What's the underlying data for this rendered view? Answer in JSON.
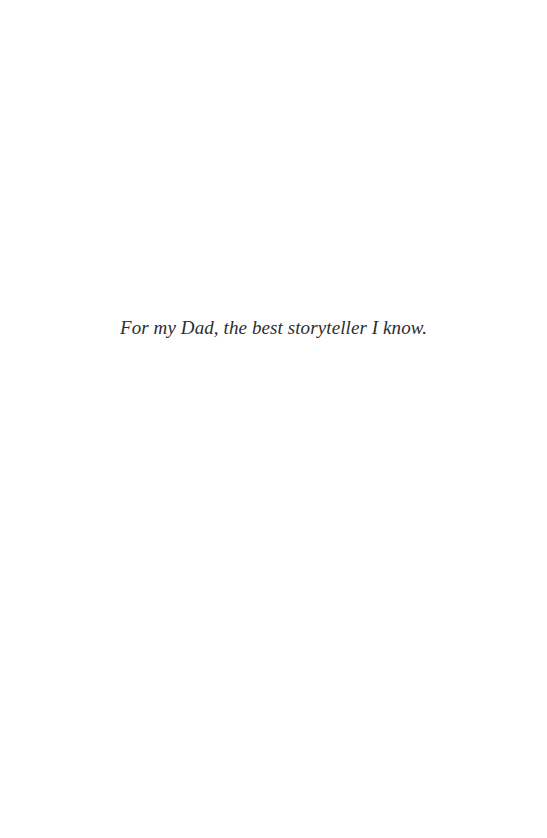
{
  "page": {
    "dedication": "For my Dad, the best storyteller I know."
  },
  "colors": {
    "background": "#ffffff",
    "text": "#2e2e2e"
  }
}
